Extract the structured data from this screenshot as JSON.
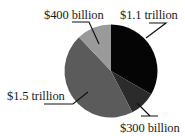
{
  "chart_data": {
    "type": "pie",
    "title": "",
    "unit": "USD",
    "start_angle_deg": 0,
    "direction": "clockwise",
    "slices": [
      {
        "label": "$1.1 trillion",
        "value": 1100,
        "color": "#050505"
      },
      {
        "label": "$300 billion",
        "value": 300,
        "color": "#2b2b2b"
      },
      {
        "label": "$1.5 trillion",
        "value": 1500,
        "color": "#5b5b5b"
      },
      {
        "label": "$400 billion",
        "value": 400,
        "color": "#9a9a9a"
      }
    ],
    "values_unit_note": "values in billions of dollars",
    "legend": "none (direct labels with leader lines)"
  },
  "labels": {
    "slice_0": "$1.1 trillion",
    "slice_1": "$300 billion",
    "slice_2": "$1.5 trillion",
    "slice_3": "$400 billion"
  },
  "style": {
    "leader_color": "#111111",
    "background": "#ffffff"
  }
}
